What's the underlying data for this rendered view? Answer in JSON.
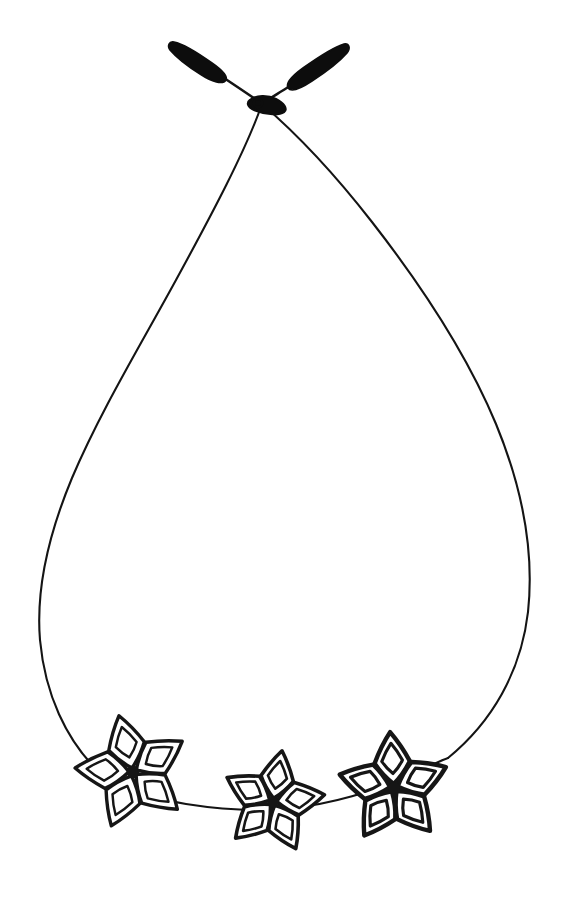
{
  "artwork": {
    "title": "Flower Bead Necklace",
    "subject": "necklace",
    "style": "hand-drawn ink line art",
    "background_color": "#ffffff",
    "ink_color": "#141414",
    "canvas": {
      "width": 570,
      "height": 899
    }
  },
  "cord": {
    "name": "necklace-cord",
    "stroke_color": "#141414",
    "stroke_width": 2.1,
    "shape": "teardrop loop",
    "knot_point": {
      "x": 262,
      "y": 103
    },
    "left_extreme_x": 37,
    "right_extreme_x": 531,
    "bottom_y": 812,
    "left_path": "M262,104 C246,150 212,214 176,280 C140,346 100,412 72,478 C47,538 36,592 40,640 C45,694 66,740 99,772",
    "right_path": "M262,104 C290,128 330,168 372,222 C418,281 466,352 496,424 C524,492 534,556 528,612 C521,672 492,722 448,758",
    "bead_strand_path": "M99,772 C118,786 150,798 186,804 C224,810 258,812 292,808 C330,804 374,792 412,774 C432,765 442,760 448,758"
  },
  "knot": {
    "name": "cord-knot",
    "ring_center": {
      "x": 258,
      "y": 103
    },
    "ring_radius": 4.2,
    "body_path": "M250,100 C256,95 268,95 276,99 C284,103 288,109 284,112 C278,116 264,114 254,110 C248,107 246,103 250,100 Z"
  },
  "tie_ends": [
    {
      "name": "tie-end-left",
      "side": "left",
      "tip": {
        "x": 172,
        "y": 44
      },
      "taper_path": "M174,42 C184,44 198,53 212,63 C222,70 228,76 226,80 C223,85 212,82 200,74 C187,66 176,57 170,50 C167,46 169,41 174,42 Z",
      "thin_path": "M224,78 C236,86 248,94 258,101"
    },
    {
      "name": "tie-end-right",
      "side": "right",
      "tip": {
        "x": 346,
        "y": 46
      },
      "taper_path": "M344,44 C349,43 351,48 347,53 C340,61 326,72 312,81 C300,89 291,92 288,88 C285,83 292,76 303,68 C317,58 334,47 344,44 Z",
      "thin_path": "M290,86 C280,92 271,98 264,102"
    }
  ],
  "flowers": [
    {
      "name": "flower-bead-left",
      "index": 1,
      "center": {
        "x": 133,
        "y": 772
      },
      "radius": 58,
      "rotation_deg": -14,
      "petal_count": 5,
      "stroke_width": 3.4,
      "core_radius": 6.5
    },
    {
      "name": "flower-bead-middle",
      "index": 2,
      "center": {
        "x": 273,
        "y": 802
      },
      "radius": 52,
      "rotation_deg": 10,
      "petal_count": 5,
      "stroke_width": 3.6,
      "core_radius": 5.5
    },
    {
      "name": "flower-bead-right",
      "index": 3,
      "center": {
        "x": 394,
        "y": 788
      },
      "radius": 56,
      "rotation_deg": -4,
      "petal_count": 5,
      "stroke_width": 4.4,
      "core_radius": 6.0
    }
  ]
}
